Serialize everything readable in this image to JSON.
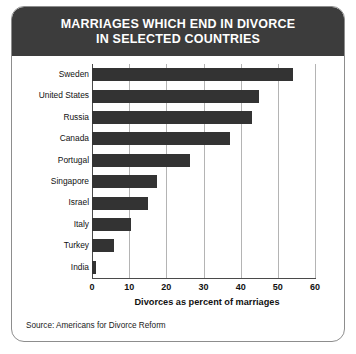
{
  "header": {
    "title_line_1": "MARRIAGES WHICH END IN DIVORCE",
    "title_line_2": "IN SELECTED COUNTRIES",
    "background_color": "#3c3c3c",
    "text_color": "#ffffff"
  },
  "source": {
    "text": "Source: Americans for Divorce Reform"
  },
  "colors": {
    "bar": "#333333",
    "gridline": "#b4b4b4",
    "axis": "#4a4a4a",
    "card_border": "#8d8d8d"
  },
  "chart_data": {
    "type": "bar",
    "orientation": "horizontal",
    "title": "MARRIAGES WHICH END IN DIVORCE IN SELECTED COUNTRIES",
    "xlabel": "Divorces as percent of marriages",
    "ylabel": "",
    "categories": [
      "Sweden",
      "United States",
      "Russia",
      "Canada",
      "Portugal",
      "Singapore",
      "Israel",
      "Italy",
      "Turkey",
      "India"
    ],
    "values": [
      54,
      45,
      43,
      37,
      26.5,
      17.5,
      15,
      10.5,
      6,
      1
    ],
    "xlim": [
      0,
      60
    ],
    "xticks": [
      0,
      10,
      20,
      30,
      40,
      50,
      60
    ],
    "xtick_labels": [
      "0",
      "10",
      "20",
      "30",
      "40",
      "50",
      "60"
    ],
    "grid": true,
    "grid_axis": "x",
    "legend": false,
    "bar_color": "#333333",
    "source": "Source: Americans for Divorce Reform"
  }
}
